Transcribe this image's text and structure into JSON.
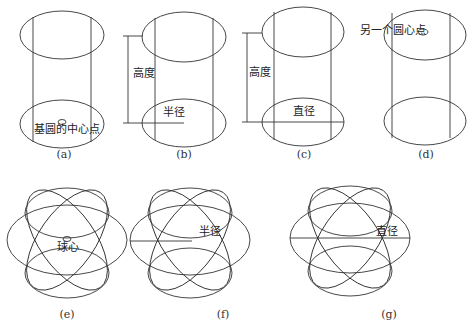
{
  "figures": [
    {
      "id": "a",
      "caption": "(a)",
      "labels": {
        "base_center": "基圆的中心点"
      }
    },
    {
      "id": "b",
      "caption": "(b)",
      "labels": {
        "height": "高度",
        "radius": "半径"
      }
    },
    {
      "id": "c",
      "caption": "(c)",
      "labels": {
        "height": "高度",
        "diameter": "直径"
      }
    },
    {
      "id": "d",
      "caption": "(d)",
      "labels": {
        "other_center": "另一个圆心点"
      }
    },
    {
      "id": "e",
      "caption": "(e)",
      "labels": {
        "sphere_center": "球心"
      }
    },
    {
      "id": "f",
      "caption": "(f)",
      "labels": {
        "radius": "半径"
      }
    },
    {
      "id": "g",
      "caption": "(g)",
      "labels": {
        "diameter": "直径"
      }
    }
  ],
  "style": {
    "stroke": "#333333",
    "background": "#ffffff"
  }
}
